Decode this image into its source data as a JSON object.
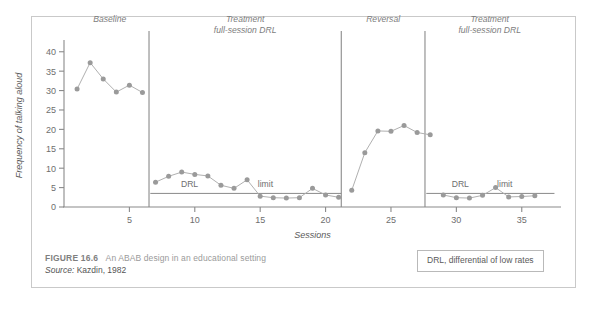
{
  "figure": {
    "caption_number": "FIGURE 16.6",
    "caption_title": "An ABAB design in an educational setting",
    "source_label": "Source:",
    "source_text": " Kazdin, 1982"
  },
  "legend": {
    "note": "DRL, differential of low rates"
  },
  "colors": {
    "marker": "#9a9a9a",
    "line": "#b0b0b0",
    "axis": "#8a8a8a",
    "phase_line": "#8a8a8a",
    "frame": "#c9c9c9",
    "text": "#6e6e6e"
  },
  "chart_data": {
    "type": "line",
    "title": "",
    "xlabel": "Sessions",
    "ylabel": "Frequency of talking aloud",
    "xlim": [
      0,
      38
    ],
    "ylim": [
      0,
      42
    ],
    "yticks": [
      0,
      5,
      10,
      15,
      20,
      25,
      30,
      35,
      40
    ],
    "xticks": [
      5,
      10,
      15,
      20,
      25,
      30,
      35
    ],
    "grid": false,
    "legend_position": "none",
    "phases": [
      {
        "name": "Baseline",
        "label_lines": [
          "Baseline"
        ],
        "x_start": 0.5,
        "x_end": 6.5
      },
      {
        "name": "Treatment 1",
        "label_lines": [
          "Treatment",
          "full-session DRL"
        ],
        "x_start": 6.5,
        "x_end": 21.2
      },
      {
        "name": "Reversal",
        "label_lines": [
          "Reversal"
        ],
        "x_start": 21.2,
        "x_end": 27.6
      },
      {
        "name": "Treatment 2",
        "label_lines": [
          "Treatment",
          "full-session DRL"
        ],
        "x_start": 27.6,
        "x_end": 37.5
      }
    ],
    "phase_divider_x": [
      6.5,
      21.2,
      27.6
    ],
    "drl_limit_value": 3.5,
    "drl_limit_segments": [
      {
        "x_start": 6.6,
        "x_end": 21.2
      },
      {
        "x_start": 27.7,
        "x_end": 37.5
      }
    ],
    "annotations": [
      {
        "text": "DRL",
        "x": 9.6,
        "y": 5.2
      },
      {
        "text": "limit",
        "x": 15.4,
        "y": 5.2
      },
      {
        "text": "DRL",
        "x": 30.3,
        "y": 5.2
      },
      {
        "text": "limit",
        "x": 33.7,
        "y": 5.2
      }
    ],
    "series": [
      {
        "name": "Baseline",
        "x": [
          1,
          2,
          3,
          4,
          5,
          6
        ],
        "values": [
          30.4,
          37.2,
          33.0,
          29.6,
          31.4,
          29.5
        ]
      },
      {
        "name": "Treatment full-session DRL (first)",
        "x": [
          7,
          8,
          9,
          10,
          11,
          12,
          13,
          14,
          15,
          16,
          17,
          18,
          19,
          20,
          21
        ],
        "values": [
          6.4,
          7.9,
          9.0,
          8.4,
          8.0,
          5.6,
          4.8,
          7.0,
          2.8,
          2.4,
          2.3,
          2.4,
          4.8,
          3.1,
          2.5
        ]
      },
      {
        "name": "Reversal",
        "x": [
          22,
          23,
          24,
          25,
          26,
          27,
          28
        ],
        "values": [
          4.3,
          14.0,
          19.6,
          19.5,
          21.0,
          19.2,
          18.6
        ]
      },
      {
        "name": "Treatment full-session DRL (second)",
        "x": [
          29,
          30,
          31,
          32,
          33,
          34,
          35,
          36
        ],
        "values": [
          3.1,
          2.4,
          2.3,
          3.0,
          5.0,
          2.6,
          2.7,
          2.9
        ]
      }
    ]
  }
}
